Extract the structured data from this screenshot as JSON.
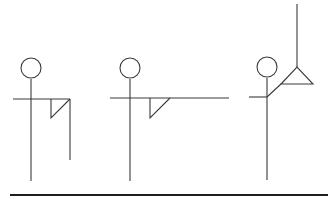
{
  "diagram": {
    "type": "stick-figure-sequence",
    "line_color": "#3a3a3a",
    "ground_color": "#1e1e1e",
    "background": "#ffffff",
    "figures": [
      {
        "name": "figure-1",
        "head": {
          "cx": 31,
          "cy": 68,
          "r": 10
        },
        "body": {
          "x": 31,
          "y1": 79,
          "y2": 181
        },
        "arm": {
          "x1": 13,
          "y": 99,
          "x2": 70
        },
        "flag": [
          [
            51,
            99
          ],
          [
            51,
            118
          ],
          [
            70,
            99
          ]
        ],
        "pole": {
          "x": 70,
          "y1": 99,
          "y2": 160
        }
      },
      {
        "name": "figure-2",
        "head": {
          "cx": 130,
          "cy": 68,
          "r": 10
        },
        "body": {
          "x": 130,
          "y1": 79,
          "y2": 181
        },
        "arm": {
          "x1": 110,
          "y": 98,
          "x2": 229
        },
        "flag": [
          [
            150,
            98
          ],
          [
            150,
            118
          ],
          [
            170,
            98
          ]
        ]
      },
      {
        "name": "figure-3",
        "head": {
          "cx": 267,
          "cy": 67,
          "r": 10
        },
        "body": {
          "x": 267,
          "y1": 78,
          "y2": 180
        },
        "arm": {
          "x1": 249,
          "y": 97,
          "x2": 267
        },
        "reach": {
          "x1": 267,
          "y1": 97,
          "x2": 281,
          "y2": 84
        },
        "triangle": [
          [
            281,
            84
          ],
          [
            297,
            67
          ],
          [
            313,
            84
          ]
        ],
        "pole": {
          "x": 297,
          "y1": 4,
          "y2": 67
        }
      }
    ],
    "ground": {
      "x1": 10,
      "y": 195,
      "x2": 328
    }
  }
}
